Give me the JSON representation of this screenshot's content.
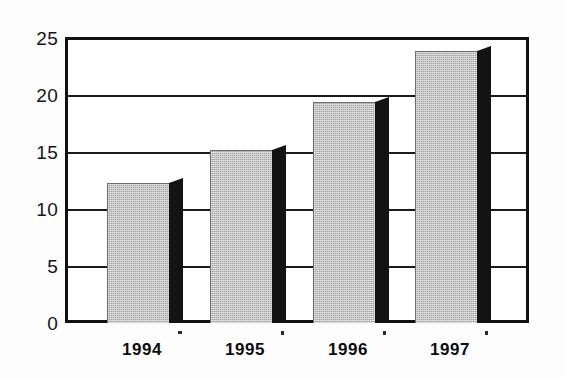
{
  "chart_data": {
    "type": "bar",
    "title": "",
    "subtitle": "",
    "xlabel": "",
    "ylabel": "",
    "categories": [
      "1994",
      "1995",
      "1996",
      "1997"
    ],
    "values": [
      12.4,
      15.3,
      19.5,
      24.0
    ],
    "series": [
      {
        "name": "",
        "values": [
          12.4,
          15.3,
          19.5,
          24.0
        ]
      }
    ],
    "ylim": [
      0,
      25
    ],
    "y_ticks": [
      0,
      5,
      10,
      15,
      20,
      25
    ],
    "y_tick_labels": [
      "0",
      "5",
      "10",
      "15",
      "20",
      "25"
    ],
    "grid": true,
    "grid_axis": "y",
    "legend": false,
    "legend_position": "none",
    "annotations": [],
    "style": {
      "bar_face_color": "#a2a2a2",
      "bar_side_color": "#131313",
      "frame_color": "#111111",
      "grid_color": "#1a1a1a",
      "background_color": "#ffffff",
      "three_d": true
    }
  },
  "axes": {
    "y": {
      "ticks": [
        {
          "label": "25",
          "value": 25
        },
        {
          "label": "20",
          "value": 20
        },
        {
          "label": "15",
          "value": 15
        },
        {
          "label": "10",
          "value": 10
        },
        {
          "label": "5",
          "value": 5
        },
        {
          "label": "0",
          "value": 0
        }
      ]
    },
    "x": {
      "ticks": [
        {
          "label": "1994"
        },
        {
          "label": "1995"
        },
        {
          "label": "1996"
        },
        {
          "label": "1997"
        }
      ]
    }
  }
}
